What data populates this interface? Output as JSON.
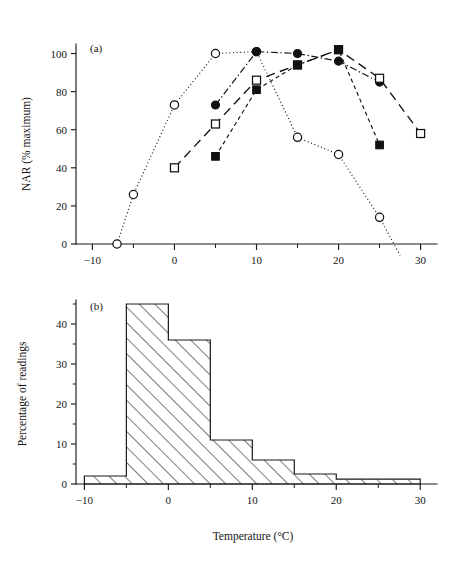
{
  "figure": {
    "panel_a_label": "(a)",
    "panel_b_label": "(b)"
  },
  "chart_data": [
    {
      "type": "line",
      "panel": "(a)",
      "title": "",
      "xlabel": "",
      "ylabel": "NAR (% maximum)",
      "xlim": [
        -12,
        32
      ],
      "ylim": [
        0,
        105
      ],
      "xticks": [
        -10,
        0,
        10,
        20,
        30
      ],
      "xtick_labels": [
        "−10",
        "0",
        "10",
        "20",
        "30"
      ],
      "xminor_ticks": [
        -5,
        5,
        15,
        25
      ],
      "yticks": [
        0,
        20,
        40,
        60,
        80,
        100
      ],
      "ytick_labels": [
        "0",
        "20",
        "40",
        "60",
        "80",
        "100"
      ],
      "grid": false,
      "legend_position": "none",
      "series": [
        {
          "name": "open-circle",
          "marker": "open-circle",
          "linestyle": "dotted",
          "x": [
            -7,
            -5,
            0,
            5,
            10,
            15,
            20,
            25,
            27.5
          ],
          "y": [
            0,
            26,
            73,
            100,
            101,
            56,
            47,
            14,
            -6
          ]
        },
        {
          "name": "filled-circle",
          "marker": "filled-circle",
          "linestyle": "dashdot",
          "x": [
            5,
            10,
            15,
            20,
            25
          ],
          "y": [
            73,
            101,
            100,
            96,
            85
          ]
        },
        {
          "name": "open-square",
          "marker": "open-square",
          "linestyle": "longdash",
          "x": [
            0,
            5,
            10,
            15,
            20,
            25,
            30
          ],
          "y": [
            40,
            63,
            86,
            94,
            102,
            87,
            58
          ]
        },
        {
          "name": "filled-square",
          "marker": "filled-square",
          "linestyle": "shortdash",
          "x": [
            5,
            10,
            15,
            20,
            25
          ],
          "y": [
            46,
            81,
            94,
            102,
            52
          ]
        }
      ]
    },
    {
      "type": "bar",
      "panel": "(b)",
      "title": "",
      "xlabel": "Temperature (°C)",
      "ylabel": "Percentage of readings",
      "xlim": [
        -11,
        32
      ],
      "ylim": [
        0,
        46
      ],
      "xticks": [
        -10,
        0,
        10,
        20,
        30
      ],
      "xtick_labels": [
        "−10",
        "0",
        "10",
        "20",
        "30"
      ],
      "xminor_ticks": [
        -5,
        5,
        15,
        25
      ],
      "yticks": [
        0,
        10,
        20,
        30,
        40
      ],
      "ytick_labels": [
        "0",
        "10",
        "20",
        "30",
        "40"
      ],
      "yminor_ticks": [
        5,
        15,
        25,
        35,
        45
      ],
      "grid": false,
      "legend_position": "none",
      "bin_edges": [
        -10,
        -5,
        0,
        5,
        10,
        15,
        20,
        25,
        30
      ],
      "bin_labels": [
        "−10 to −5",
        "−5 to 0",
        "0 to 5",
        "5 to 10",
        "10 to 15",
        "15 to 20",
        "20 to 25",
        "25 to 30"
      ],
      "values": [
        2,
        45,
        36,
        11,
        6,
        2.5,
        1.2,
        1.2
      ]
    }
  ]
}
